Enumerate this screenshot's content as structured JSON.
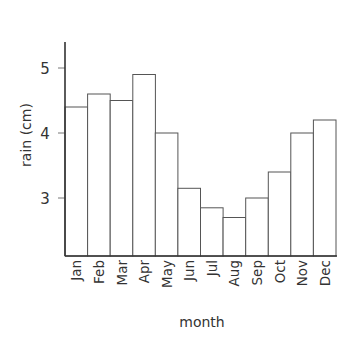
{
  "chart_data": {
    "type": "bar",
    "title": "",
    "xlabel": "month",
    "ylabel": "rain (cm)",
    "categories": [
      "Jan",
      "Feb",
      "Mar",
      "Apr",
      "May",
      "Jun",
      "Jul",
      "Aug",
      "Sep",
      "Oct",
      "Nov",
      "Dec"
    ],
    "values": [
      4.4,
      4.6,
      4.5,
      4.9,
      4.0,
      3.15,
      2.85,
      2.7,
      3.0,
      3.4,
      4.0,
      4.2
    ],
    "ylim": [
      2.1,
      5.4
    ],
    "yticks": [
      3,
      4,
      5
    ],
    "ytick_labels": [
      "3",
      "4",
      "5"
    ],
    "grid": false,
    "legend": null,
    "colors": {
      "bar_fill": "#ffffff",
      "bar_stroke": "#555555",
      "axis": "#333333"
    }
  }
}
